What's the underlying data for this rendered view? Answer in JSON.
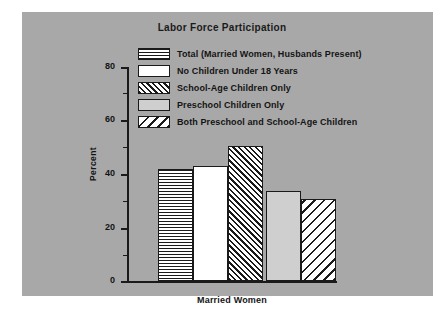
{
  "chart_data": {
    "type": "bar",
    "title": "Labor Force Participation",
    "xlabel": "Married Women",
    "ylabel": "Percent",
    "ylim": [
      0,
      80
    ],
    "yticks": [
      0,
      20,
      40,
      60,
      80
    ],
    "yminor_step": 10,
    "grid": false,
    "legend_position": "upper-center",
    "categories": [
      "Married Women"
    ],
    "series": [
      {
        "name": "Total (Married Women, Husbands Present)",
        "value": 42,
        "pattern": "horizontal-lines"
      },
      {
        "name": "No Children Under 18 Years",
        "value": 43,
        "pattern": "white-solid"
      },
      {
        "name": "School-Age Children Only",
        "value": 50.5,
        "pattern": "forward-diagonal-hatch"
      },
      {
        "name": "Preschool Children Only",
        "value": 33.5,
        "pattern": "light-gray-solid"
      },
      {
        "name": "Both Preschool and School-Age Children",
        "value": 30.5,
        "pattern": "backward-diagonal-hatch"
      }
    ]
  },
  "figure": {
    "panel_color": "#a8a8a8",
    "page_color": "#ffffff",
    "ink_color": "#1a1a1a"
  }
}
